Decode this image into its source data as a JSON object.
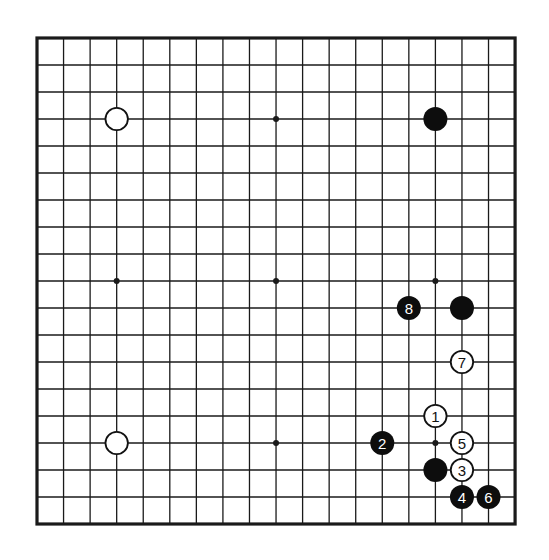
{
  "board": {
    "size": 19,
    "origin_x": 37,
    "origin_y": 38,
    "spacing_x": 26.56,
    "spacing_y": 27.0,
    "line_color": "#1a1a1a",
    "background": "#ffffff",
    "star_points": [
      [
        3,
        3
      ],
      [
        9,
        3
      ],
      [
        15,
        3
      ],
      [
        3,
        9
      ],
      [
        9,
        9
      ],
      [
        15,
        9
      ],
      [
        3,
        15
      ],
      [
        9,
        15
      ],
      [
        15,
        15
      ]
    ]
  },
  "stones": [
    {
      "color": "white",
      "col": 3,
      "row": 3,
      "label": ""
    },
    {
      "color": "black",
      "col": 15,
      "row": 3,
      "label": ""
    },
    {
      "color": "white",
      "col": 3,
      "row": 15,
      "label": ""
    },
    {
      "color": "black",
      "col": 16,
      "row": 10,
      "label": ""
    },
    {
      "color": "black",
      "col": 15,
      "row": 16,
      "label": ""
    },
    {
      "color": "white",
      "col": 15,
      "row": 14,
      "label": "1"
    },
    {
      "color": "black",
      "col": 13,
      "row": 15,
      "label": "2"
    },
    {
      "color": "white",
      "col": 16,
      "row": 16,
      "label": "3"
    },
    {
      "color": "black",
      "col": 16,
      "row": 17,
      "label": "4"
    },
    {
      "color": "white",
      "col": 16,
      "row": 15,
      "label": "5"
    },
    {
      "color": "black",
      "col": 17,
      "row": 17,
      "label": "6"
    },
    {
      "color": "white",
      "col": 16,
      "row": 12,
      "label": "7"
    },
    {
      "color": "black",
      "col": 14,
      "row": 10,
      "label": "8"
    }
  ]
}
